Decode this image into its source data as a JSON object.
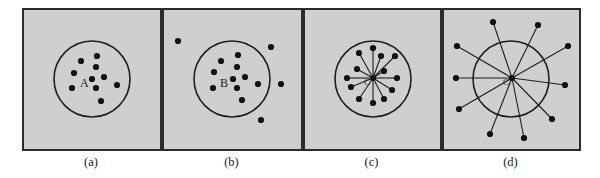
{
  "figure": {
    "colors": {
      "panel_fill": "#cfcfcf",
      "panel_border": "#2b2b2b",
      "ink": "#111111"
    },
    "panels": [
      {
        "id": "a",
        "caption": "(a)",
        "center_label": "A",
        "has_spokes": false,
        "center": [
          92,
          79
        ],
        "radius": 38,
        "points": [
          [
            97,
            56
          ],
          [
            81,
            61
          ],
          [
            96,
            67
          ],
          [
            74,
            73
          ],
          [
            104,
            77
          ],
          [
            92,
            79
          ],
          [
            117,
            85
          ],
          [
            72,
            88
          ],
          [
            96,
            88
          ],
          [
            101,
            101
          ]
        ]
      },
      {
        "id": "b",
        "caption": "(b)",
        "center_label": "B",
        "has_spokes": false,
        "center": [
          232,
          79
        ],
        "radius": 38,
        "points": [
          [
            178,
            41
          ],
          [
            271,
            47
          ],
          [
            238,
            55
          ],
          [
            221,
            61
          ],
          [
            237,
            67
          ],
          [
            214,
            72
          ],
          [
            245,
            77
          ],
          [
            233,
            79
          ],
          [
            258,
            84
          ],
          [
            281,
            84
          ],
          [
            213,
            88
          ],
          [
            237,
            88
          ],
          [
            242,
            100
          ],
          [
            261,
            120
          ]
        ]
      },
      {
        "id": "c",
        "caption": "(c)",
        "center_label": "C",
        "has_spokes": true,
        "center": [
          373,
          79
        ],
        "radius": 38,
        "hub": [
          373,
          78
        ],
        "points": [
          [
            373,
            48
          ],
          [
            359,
            53
          ],
          [
            381,
            56
          ],
          [
            395,
            56
          ],
          [
            357,
            69
          ],
          [
            384,
            71
          ],
          [
            347,
            78
          ],
          [
            397,
            78
          ],
          [
            351,
            87
          ],
          [
            392,
            90
          ],
          [
            359,
            99
          ],
          [
            384,
            99
          ],
          [
            373,
            103
          ]
        ]
      },
      {
        "id": "d",
        "caption": "(d)",
        "center_label": "C",
        "has_spokes": true,
        "center": [
          511,
          79
        ],
        "radius": 38,
        "hub": [
          512,
          78
        ],
        "points": [
          [
            493,
            22
          ],
          [
            538,
            25
          ],
          [
            457,
            46
          ],
          [
            568,
            46
          ],
          [
            456,
            78
          ],
          [
            565,
            85
          ],
          [
            459,
            109
          ],
          [
            552,
            119
          ],
          [
            490,
            134
          ],
          [
            524,
            138
          ]
        ]
      }
    ]
  }
}
